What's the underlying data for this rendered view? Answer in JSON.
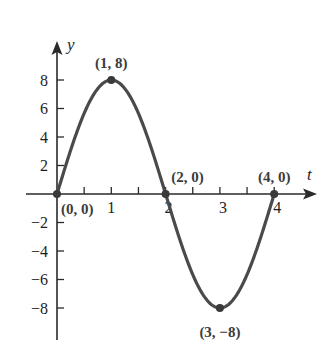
{
  "chart_data": {
    "type": "line",
    "title": "",
    "xlabel": "t",
    "ylabel": "y",
    "xlim": [
      0,
      4.75
    ],
    "ylim": [
      -10,
      10
    ],
    "grid": false,
    "legend": null,
    "x_ticks": [
      0.5,
      1,
      1.5,
      2,
      2.5,
      3,
      3.5,
      4
    ],
    "x_tick_labels": [
      {
        "value": 1,
        "label": "1"
      },
      {
        "value": 2,
        "label": "2"
      },
      {
        "value": 3,
        "label": "3"
      },
      {
        "value": 4,
        "label": "4"
      }
    ],
    "y_ticks": [
      {
        "value": 8,
        "label": "8"
      },
      {
        "value": 6,
        "label": "6"
      },
      {
        "value": 4,
        "label": "4"
      },
      {
        "value": 2,
        "label": "2"
      },
      {
        "value": -2,
        "label": "−2"
      },
      {
        "value": -4,
        "label": "−4"
      },
      {
        "value": -6,
        "label": "−6"
      },
      {
        "value": -8,
        "label": "−8"
      }
    ],
    "series": [
      {
        "name": "y = 8 sin(πt/2)",
        "color": "#4a4a4a",
        "x": [
          0,
          0.25,
          0.5,
          0.75,
          1,
          1.25,
          1.5,
          1.75,
          2,
          2.25,
          2.5,
          2.75,
          3,
          3.25,
          3.5,
          3.75,
          4
        ],
        "values": [
          0,
          3.06,
          5.66,
          7.39,
          8,
          7.39,
          5.66,
          3.06,
          0,
          -3.06,
          -5.66,
          -7.39,
          -8,
          -7.39,
          -5.66,
          -3.06,
          0
        ]
      }
    ],
    "annotations": [
      {
        "x": 0,
        "y": 0,
        "label": "(0, 0)"
      },
      {
        "x": 1,
        "y": 8,
        "label": "(1, 8)"
      },
      {
        "x": 2,
        "y": 0,
        "label": "(2, 0)"
      },
      {
        "x": 3,
        "y": -8,
        "label": "(3, −8)"
      },
      {
        "x": 4,
        "y": 0,
        "label": "(4, 0)"
      }
    ]
  }
}
